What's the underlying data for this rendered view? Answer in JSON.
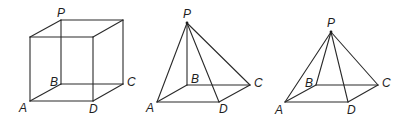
{
  "figures": [
    {
      "name": "cube",
      "labels": {
        "P": "P",
        "A": "A",
        "B": "B",
        "C": "C",
        "D": "D"
      }
    },
    {
      "name": "pyramid-vertex-above-B",
      "labels": {
        "P": "P",
        "A": "A",
        "B": "B",
        "C": "C",
        "D": "D"
      }
    },
    {
      "name": "pyramid-vertex-central",
      "labels": {
        "P": "P",
        "A": "A",
        "B": "B",
        "C": "C",
        "D": "D"
      }
    }
  ]
}
